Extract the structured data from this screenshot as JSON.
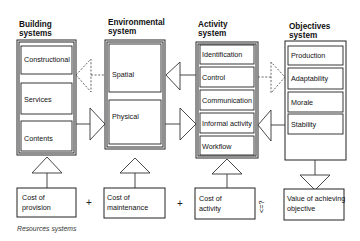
{
  "columns": {
    "building": {
      "title_line1": "Building",
      "title_line2": "systems",
      "items": [
        "Constructional",
        "Services",
        "Contents"
      ]
    },
    "environmental": {
      "title_line1": "Environmental",
      "title_line2": "system",
      "items": [
        "Spatial",
        "Physical"
      ]
    },
    "activity": {
      "title_line1": "Activity",
      "title_line2": "system",
      "items": [
        "Identification",
        "Control",
        "Communication",
        "Informal activity",
        "Workflow"
      ]
    },
    "objectives": {
      "title_line1": "Objectives",
      "title_line2": "system",
      "items": [
        "Production",
        "Adaptability",
        "Morale",
        "Stability"
      ]
    }
  },
  "resources": {
    "cost_provision": {
      "line1": "Cost of",
      "line2": "provision"
    },
    "cost_maintenance": {
      "line1": "Cost of",
      "line2": "maintenance"
    },
    "cost_activity": {
      "line1": "Cost of",
      "line2": "activity"
    },
    "value_objective": {
      "line1": "Value of achieving",
      "line2": "objective"
    },
    "plus_1": "+",
    "plus_2": "+",
    "comparison": "<=?",
    "caption": "Resources systems"
  }
}
